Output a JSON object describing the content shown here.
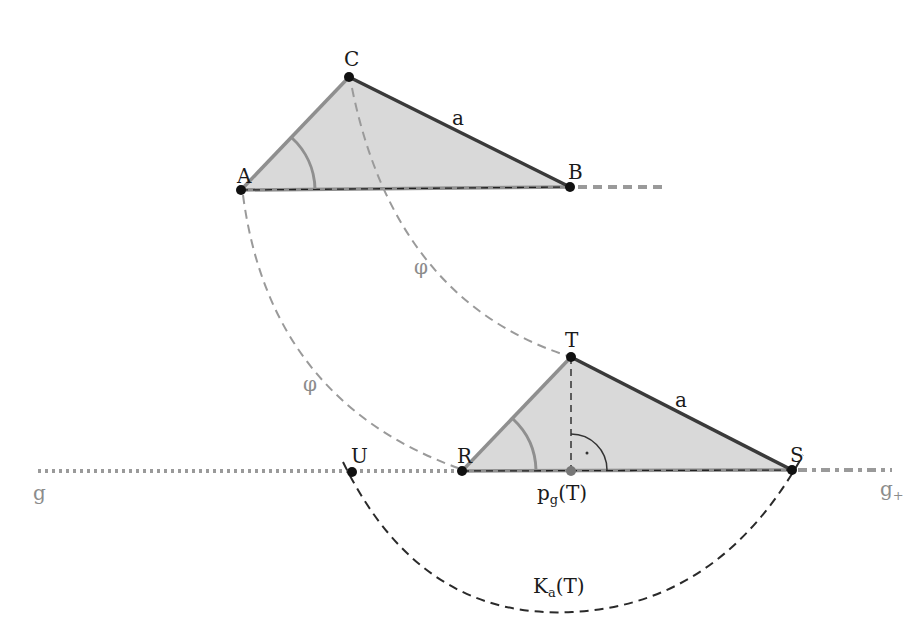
{
  "diagram": {
    "colors": {
      "triangle_fill": "#d9d9d9",
      "side_a": "#3a3a3a",
      "side_gray": "#8f8f8f",
      "construction_dashed": "#9a9a9a",
      "circle_dashed": "#2a2a2a",
      "line_g": "#9a9a9a",
      "points": "#111111",
      "foot_point": "#777777"
    },
    "points": {
      "A": {
        "label": "A",
        "x": 241,
        "y": 190
      },
      "B": {
        "label": "B",
        "x": 570,
        "y": 187
      },
      "C": {
        "label": "C",
        "x": 349,
        "y": 77
      },
      "T": {
        "label": "T",
        "x": 571,
        "y": 357
      },
      "R": {
        "label": "R",
        "x": 462,
        "y": 471
      },
      "S": {
        "label": "S",
        "x": 792,
        "y": 470
      },
      "U": {
        "label": "U",
        "x": 352,
        "y": 472
      },
      "P": {
        "label_main": "p",
        "label_sub": "g",
        "label_tail": "(T)",
        "x": 571,
        "y": 471
      }
    },
    "labels": {
      "side_a_top": "a",
      "side_a_bottom": "a",
      "phi_upper": "φ",
      "phi_lower": "φ",
      "line_g": "g",
      "line_g_plus_main": "g",
      "line_g_plus_sub": "+",
      "circle_main": "K",
      "circle_sub": "a",
      "circle_tail": "(T)"
    },
    "triangles": [
      {
        "name": "ABC",
        "vertices": [
          "A",
          "B",
          "C"
        ]
      },
      {
        "name": "RST",
        "vertices": [
          "R",
          "S",
          "T"
        ]
      }
    ]
  }
}
